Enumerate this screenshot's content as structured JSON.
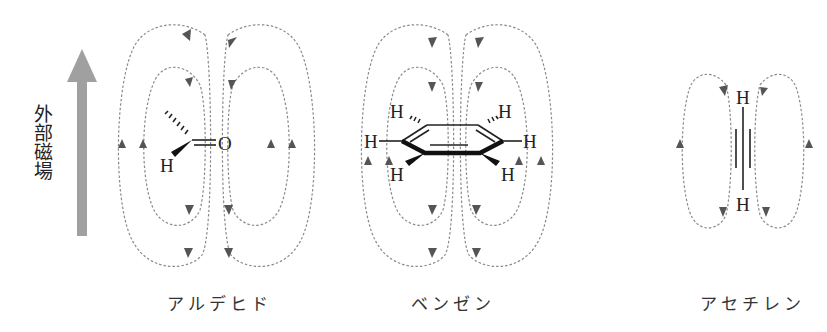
{
  "field": {
    "label": "外部磁場",
    "arrow_color": "#a0a0a0",
    "direction": "up"
  },
  "molecules": [
    {
      "id": "aldehyde",
      "name": "アルデヒド",
      "atoms": [
        "H",
        "O"
      ],
      "bond": "C=O double bond",
      "loop_pairs": 2,
      "circulation": "downward inside, upward outside"
    },
    {
      "id": "benzene",
      "name": "ベンゼン",
      "atoms": [
        "H",
        "H",
        "H",
        "H",
        "H",
        "H"
      ],
      "bond": "aromatic ring",
      "loop_pairs": 2,
      "circulation": "downward inside, upward outside"
    },
    {
      "id": "acetylene",
      "name": "アセチレン",
      "atoms": [
        "H",
        "H"
      ],
      "bond": "C≡C triple bond",
      "loop_pairs": 1,
      "circulation": "downward inside, upward outside"
    }
  ],
  "colors": {
    "field_line": "#8a8a8a",
    "arrowhead": "#555555",
    "text": "#222222"
  }
}
